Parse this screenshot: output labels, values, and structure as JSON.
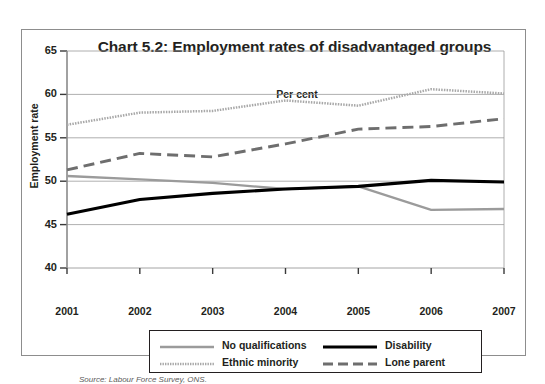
{
  "figure": {
    "title": "Chart 5.2: Employment rates of disadvantaged groups",
    "unit_label": "Per cent",
    "y_axis_title": "Employment rate",
    "source": "Source: Labour Force Survey, ONS."
  },
  "legend": {
    "entries": [
      {
        "label": "No qualifications",
        "style": "solid-gray",
        "color": "#9b9b9b",
        "icon": "line-swatch-icon"
      },
      {
        "label": "Disability",
        "style": "solid-black",
        "color": "#000000",
        "icon": "line-swatch-icon"
      },
      {
        "label": "Ethnic minority",
        "style": "dotted-gray",
        "color": "#a8a8a8",
        "icon": "dotted-line-swatch-icon"
      },
      {
        "label": "Lone parent",
        "style": "dashed-gray",
        "color": "#6e6e6e",
        "icon": "dashed-line-swatch-icon"
      }
    ]
  },
  "chart_data": {
    "type": "line",
    "title": "Chart 5.2: Employment rates of disadvantaged groups",
    "subtitle": "Per cent",
    "xlabel": "",
    "ylabel": "Employment rate",
    "categories": [
      "2001",
      "2002",
      "2003",
      "2004",
      "2005",
      "2006",
      "2007"
    ],
    "x_tick_labels": [
      "2001",
      "2002",
      "2003",
      "2004",
      "2005",
      "2006",
      "2007"
    ],
    "y_tick_labels": [
      "40",
      "45",
      "50",
      "55",
      "60",
      "65"
    ],
    "ylim": [
      40,
      65
    ],
    "ytick_step": 5,
    "grid": "horizontal",
    "legend_position": "bottom",
    "series": [
      {
        "name": "No qualifications",
        "color": "#9b9b9b",
        "style": "solid",
        "values": [
          50.6,
          50.2,
          49.8,
          49.1,
          49.4,
          46.7,
          46.8
        ]
      },
      {
        "name": "Ethnic minority",
        "color": "#a8a8a8",
        "style": "dotted",
        "values": [
          56.5,
          57.9,
          58.1,
          59.3,
          58.7,
          60.6,
          60.1
        ]
      },
      {
        "name": "Disability",
        "color": "#000000",
        "style": "solid",
        "values": [
          46.2,
          47.9,
          48.6,
          49.1,
          49.4,
          50.1,
          49.9
        ]
      },
      {
        "name": "Lone parent",
        "color": "#6e6e6e",
        "style": "dashed",
        "values": [
          51.3,
          53.2,
          52.8,
          54.3,
          56.0,
          56.3,
          57.2
        ]
      }
    ],
    "source": "Source: Labour Force Survey, ONS."
  }
}
